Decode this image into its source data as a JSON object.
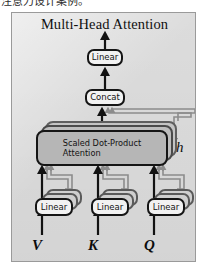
{
  "caption": {
    "text": "注意力设计案例。"
  },
  "figure": {
    "title": "Multi-Head Attention",
    "frame": {
      "background_color": "#dcdcdc",
      "border_color": "#9a9a9a"
    },
    "nodes": {
      "linear_output": {
        "label": "Linear"
      },
      "concat": {
        "label": "Concat"
      },
      "attention": {
        "label_line1": "Scaled Dot-Product",
        "label_line2": "Attention",
        "fill_color": "#b6b6b6",
        "stacked_copies": 2
      },
      "linear_v": {
        "label": "Linear"
      },
      "linear_k": {
        "label": "Linear"
      },
      "linear_q": {
        "label": "Linear"
      }
    },
    "annotations": {
      "heads_multiplier": "h"
    },
    "inputs": {
      "value": "V",
      "key": "K",
      "query": "Q"
    },
    "colors": {
      "stroke_primary": "#151515",
      "stroke_secondary": "#8c8c8c",
      "node_fill": "#f2f2f2"
    }
  }
}
